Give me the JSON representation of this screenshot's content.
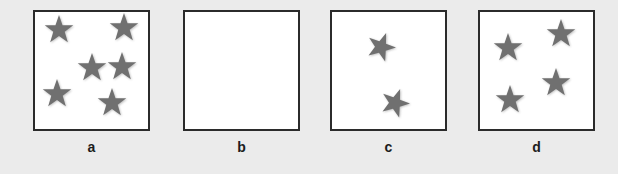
{
  "figure": {
    "background_color": "#ebebeb",
    "panel_fill_color": "#ffffff",
    "panel_border_color": "#2b2b2b",
    "star_color": "#707070",
    "label_color": "#1c1c1c"
  },
  "panels": [
    {
      "label": "a",
      "star_count": 6,
      "x": 33,
      "y": 10,
      "width": 117,
      "height": 121,
      "stars": [
        {
          "cx": 26,
          "cy": 20,
          "r": 15,
          "rot": 0
        },
        {
          "cx": 91,
          "cy": 18,
          "r": 15,
          "rot": 0
        },
        {
          "cx": 59,
          "cy": 58,
          "r": 15,
          "rot": 0
        },
        {
          "cx": 89,
          "cy": 57,
          "r": 15,
          "rot": 0
        },
        {
          "cx": 24,
          "cy": 84,
          "r": 15,
          "rot": 0
        },
        {
          "cx": 79,
          "cy": 93,
          "r": 15,
          "rot": 0
        }
      ]
    },
    {
      "label": "b",
      "star_count": 0,
      "x": 183,
      "y": 10,
      "width": 117,
      "height": 121,
      "stars": []
    },
    {
      "label": "c",
      "star_count": 2,
      "x": 330,
      "y": 10,
      "width": 117,
      "height": 121,
      "stars": [
        {
          "cx": 51,
          "cy": 37,
          "r": 15,
          "rot": 20
        },
        {
          "cx": 65,
          "cy": 93,
          "r": 15,
          "rot": 20
        }
      ]
    },
    {
      "label": "d",
      "star_count": 4,
      "x": 478,
      "y": 10,
      "width": 117,
      "height": 121,
      "stars": [
        {
          "cx": 30,
          "cy": 38,
          "r": 15,
          "rot": 0
        },
        {
          "cx": 83,
          "cy": 24,
          "r": 15,
          "rot": 0
        },
        {
          "cx": 78,
          "cy": 73,
          "r": 15,
          "rot": 0
        },
        {
          "cx": 32,
          "cy": 90,
          "r": 15,
          "rot": 0
        }
      ]
    }
  ]
}
